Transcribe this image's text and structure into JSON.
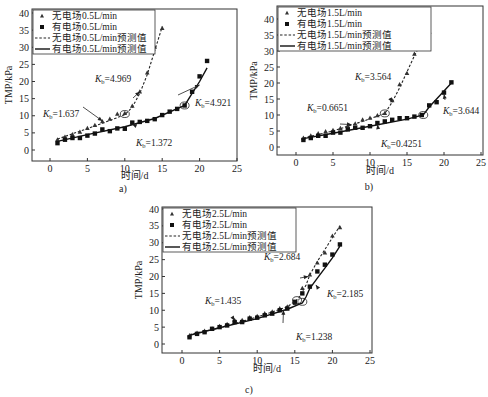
{
  "chart_data": [
    {
      "type": "scatter",
      "panel_label": "a)",
      "xlabel": "时间/d",
      "ylabel": "TMP/kPa",
      "xlim": [
        -2.5,
        25
      ],
      "ylim": [
        -3,
        41
      ],
      "xticks": [
        0,
        5,
        10,
        15,
        20,
        25
      ],
      "yticks": [
        0,
        5,
        10,
        15,
        20,
        25,
        30,
        35,
        40
      ],
      "legend_position": "top-left",
      "legend": [
        "无电场0.5L/min",
        "有电场0.5L/min",
        "无电场0.5L/min预测值",
        "有电场0.5L/min预测值"
      ],
      "series": [
        {
          "name": "无电场0.5L/min",
          "marker": "triangle",
          "x": [
            1,
            2,
            3,
            4,
            5,
            6,
            7,
            8,
            9,
            10,
            11,
            12,
            13,
            14,
            15
          ],
          "y": [
            3,
            3.8,
            4.5,
            5.2,
            6.3,
            7.2,
            8.3,
            9,
            10.5,
            10.7,
            12.8,
            17,
            22.5,
            30,
            35.5
          ]
        },
        {
          "name": "有电场0.5L/min",
          "marker": "square",
          "x": [
            1,
            2,
            3,
            4,
            5,
            6,
            7,
            8,
            9,
            10,
            11,
            12,
            13,
            14,
            15,
            16,
            17,
            18,
            19,
            20,
            21
          ],
          "y": [
            2,
            3,
            3.5,
            3.5,
            4.2,
            4.8,
            6,
            5.5,
            6.3,
            6.2,
            8,
            8.2,
            8.5,
            9,
            10.2,
            11.2,
            12,
            13,
            17,
            21.5,
            26
          ]
        },
        {
          "name": "无电场0.5L/min预测值",
          "line": "dashed",
          "x": [
            1,
            4,
            7,
            10,
            11,
            12,
            13,
            14,
            15
          ],
          "y": [
            3.2,
            5.5,
            7.8,
            10.3,
            12.5,
            16.5,
            22,
            29,
            36
          ]
        },
        {
          "name": "有电场0.5L/min预测值",
          "line": "solid",
          "x": [
            1,
            5,
            10,
            14,
            18,
            19,
            20,
            21
          ],
          "y": [
            2.5,
            4.5,
            6.8,
            9.2,
            13,
            16.5,
            20,
            24
          ]
        }
      ],
      "annotations": [
        {
          "text": "Kb=4.969",
          "at": [
            12,
            17
          ]
        },
        {
          "text": "Kb=1.637",
          "at": [
            7,
            8.5
          ]
        },
        {
          "text": "Kb=4.921",
          "at": [
            20,
            19
          ]
        },
        {
          "text": "Kb=1.372",
          "at": [
            11,
            7.5
          ]
        }
      ],
      "breakpoints": [
        [
          10,
          10.5
        ],
        [
          18,
          13
        ]
      ]
    },
    {
      "type": "scatter",
      "panel_label": "b)",
      "xlabel": "时间/d",
      "ylabel": "TMP/kPa",
      "xlim": [
        -2.5,
        25
      ],
      "ylim": [
        -3,
        42
      ],
      "xticks": [
        0,
        5,
        10,
        15,
        20,
        25
      ],
      "yticks": [
        0,
        5,
        10,
        15,
        20,
        25,
        30,
        35,
        40
      ],
      "legend_position": "top-left",
      "legend": [
        "无电场1.5L/min",
        "有电场1.5L/min",
        "无电场1.5L/min预测值",
        "有电场1.5L/min预测值"
      ],
      "series": [
        {
          "name": "无电场1.5L/min",
          "marker": "triangle",
          "x": [
            1,
            2,
            3,
            4,
            5,
            6,
            7,
            8,
            9,
            10,
            11,
            12,
            13,
            14,
            15,
            16,
            17,
            18
          ],
          "y": [
            2.8,
            3.5,
            4.2,
            4.8,
            5.2,
            5.8,
            6.5,
            7.2,
            8.5,
            9,
            9.8,
            10.5,
            14.5,
            19.5,
            23,
            29,
            33,
            36
          ]
        },
        {
          "name": "有电场1.5L/min",
          "marker": "square",
          "x": [
            1,
            2,
            3,
            4,
            5,
            6,
            7,
            8,
            9,
            10,
            11,
            12,
            13,
            14,
            15,
            16,
            17,
            18,
            19,
            20,
            21
          ],
          "y": [
            2.2,
            2.8,
            3.5,
            3.5,
            4.5,
            4.5,
            5.5,
            6,
            6,
            6.5,
            7.5,
            8,
            8.5,
            9,
            9,
            9.5,
            10,
            13,
            14,
            17,
            20.2
          ]
        },
        {
          "name": "无电场1.5L/min预测值",
          "line": "dashed",
          "x": [
            1,
            5,
            9,
            12,
            13,
            14,
            15,
            16,
            17,
            18
          ],
          "y": [
            2.8,
            5,
            8,
            10.5,
            14,
            18.5,
            23.5,
            28.5,
            33,
            38
          ]
        },
        {
          "name": "有电场1.5L/min预测值",
          "line": "solid",
          "x": [
            1,
            5,
            10,
            15,
            17.2,
            18,
            19,
            20,
            21
          ],
          "y": [
            2.6,
            4.3,
            6.5,
            8.7,
            10,
            12.5,
            15,
            17.5,
            20
          ]
        }
      ],
      "annotations": [
        {
          "text": "Kb=3.564",
          "at": [
            13,
            14
          ]
        },
        {
          "text": "Kb=0.6651",
          "at": [
            7.5,
            7
          ]
        },
        {
          "text": "Kb=3.644",
          "at": [
            20,
            16.5
          ]
        },
        {
          "text": "Kb=0.4251",
          "at": [
            11,
            7
          ]
        }
      ],
      "breakpoints": [
        [
          12,
          10.5
        ],
        [
          17.2,
          10
        ]
      ]
    },
    {
      "type": "scatter",
      "panel_label": "c)",
      "xlabel": "时间/d",
      "ylabel": "TMP/kPa",
      "xlim": [
        -2.5,
        25
      ],
      "ylim": [
        -2.5,
        40.5
      ],
      "xticks": [
        0,
        5,
        10,
        15,
        20,
        25
      ],
      "yticks": [
        0,
        5,
        10,
        15,
        20,
        25,
        30,
        35,
        40
      ],
      "legend_position": "top-left",
      "legend": [
        "无电场2.5L/min",
        "有电场2.5L/min",
        "无电场2.5L/min预测值",
        "有电场2.5L/min预测值"
      ],
      "series": [
        {
          "name": "无电场2.5L/min",
          "marker": "triangle",
          "x": [
            1,
            2,
            3,
            4,
            5,
            6,
            7,
            8,
            9,
            10,
            11,
            12,
            13,
            14,
            15,
            16,
            17,
            18,
            19,
            20,
            21
          ],
          "y": [
            2.5,
            3.2,
            3.8,
            4.5,
            5.2,
            5.8,
            7,
            7,
            7.8,
            8.2,
            9,
            9.5,
            10.5,
            11,
            12,
            16.5,
            20.5,
            24,
            27,
            32,
            34.5
          ]
        },
        {
          "name": "有电场2.5L/min",
          "marker": "square",
          "x": [
            1,
            2,
            3,
            4,
            5,
            6,
            7,
            8,
            9,
            10,
            11,
            12,
            13,
            14,
            15,
            16,
            17,
            18,
            19,
            20,
            21
          ],
          "y": [
            2,
            3,
            3.5,
            4.5,
            5,
            5.5,
            6.5,
            6.5,
            7.5,
            7.8,
            8.5,
            9,
            10,
            10.5,
            12.5,
            15,
            17,
            21.5,
            23.5,
            26.5,
            29.5
          ]
        },
        {
          "name": "无电场2.5L/min预测值",
          "line": "dashed",
          "x": [
            1,
            5,
            10,
            14,
            15.5,
            16.5,
            17,
            18,
            19,
            20,
            21
          ],
          "y": [
            2.8,
            4.8,
            8,
            11,
            13.5,
            17.5,
            20.5,
            24.5,
            28,
            31.5,
            35
          ]
        },
        {
          "name": "有电场2.5L/min预测值",
          "line": "solid",
          "x": [
            1,
            5,
            10,
            14,
            16,
            16.5,
            17,
            18,
            19,
            20,
            21
          ],
          "y": [
            2.6,
            4.8,
            7.5,
            10.3,
            12.2,
            14,
            16.5,
            19.5,
            22.5,
            25.5,
            29
          ]
        }
      ],
      "annotations": [
        {
          "text": "Kb=2.684",
          "at": [
            16.8,
            20
          ]
        },
        {
          "text": "Kb=1.435",
          "at": [
            7,
            7
          ]
        },
        {
          "text": "Kb=2.185",
          "at": [
            17.8,
            17.5
          ]
        },
        {
          "text": "Kb=1.238",
          "at": [
            13.5,
            10
          ]
        }
      ],
      "breakpoints": [
        [
          15.3,
          13
        ],
        [
          16,
          12.5
        ]
      ]
    }
  ]
}
